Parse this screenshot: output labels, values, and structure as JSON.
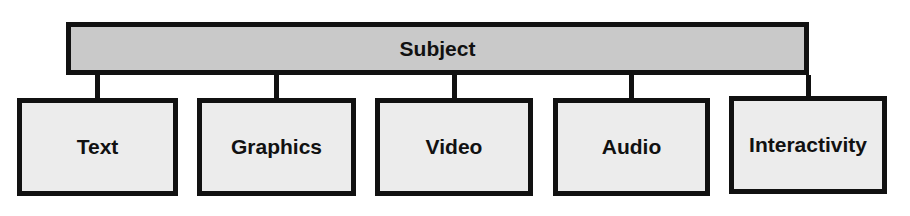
{
  "diagram": {
    "root": {
      "label": "Subject",
      "fill": "#c9c9c9"
    },
    "children": [
      {
        "label": "Text"
      },
      {
        "label": "Graphics"
      },
      {
        "label": "Video"
      },
      {
        "label": "Audio"
      },
      {
        "label": "Interactivity"
      }
    ],
    "child_fill": "#ececec",
    "stroke": "#111111"
  }
}
